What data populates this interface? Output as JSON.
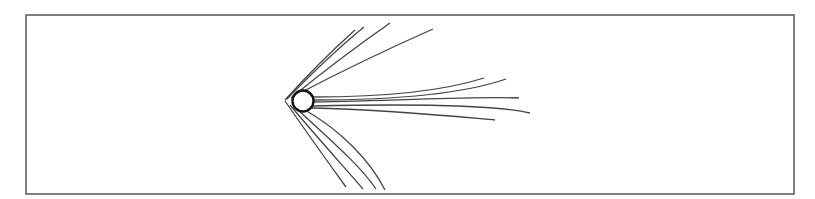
{
  "diagram": {
    "colors": {
      "background": "#ffffff",
      "frame": "#555555",
      "lines": "#444444",
      "body_stroke": "#111111",
      "body_fill": "#ffffff"
    },
    "frame": {
      "x": 26,
      "y": 15,
      "width": 768,
      "height": 179
    },
    "apex": {
      "x": 285,
      "y": 100
    },
    "body": {
      "cx": 303,
      "cy": 101,
      "r": 10.5
    },
    "upper_lines": [
      "M285,100 C310,72 335,48 355,30",
      "M287,99 C315,70 342,45 364,27",
      "M291,98 C325,70 360,44 390,23",
      "M296,95 C340,72 390,48 433,29"
    ],
    "right_lines": [
      "M313,97 C380,97 440,92 484,78",
      "M313,100 C390,100 460,95 506,79",
      "M313,102 C400,101 470,96 519,98",
      "M313,106 C400,104 490,104 530,113",
      "M312,108 C390,110 450,116 495,120"
    ],
    "lower_lines": [
      "M285,101 C305,130 330,165 346,187",
      "M290,105 C315,135 345,168 363,189",
      "M297,109 C325,135 360,165 376,189",
      "M305,110 C340,130 370,160 385,190"
    ]
  }
}
